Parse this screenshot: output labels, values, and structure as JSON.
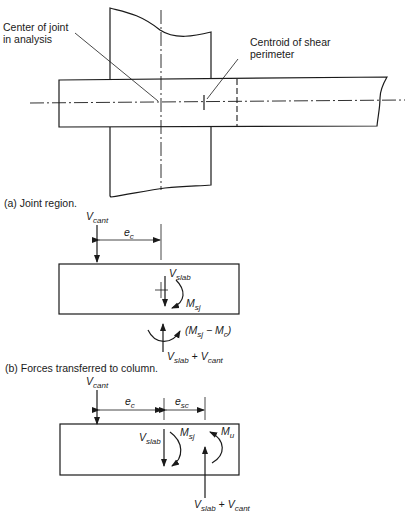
{
  "figure_a": {
    "caption": "(a) Joint region.",
    "label_center_joint_line1": "Center of joint",
    "label_center_joint_line2": "in analysis",
    "label_centroid_line1": "Centroid of shear",
    "label_centroid_line2": "perimeter"
  },
  "figure_b": {
    "caption": "(b) Forces transferred to column.",
    "v_cant": {
      "main": "V",
      "sub": "cant"
    },
    "e_c": {
      "main": "e",
      "sub": "c"
    },
    "v_slab": {
      "main": "V",
      "sub": "slab"
    },
    "m_sj": {
      "main": "M",
      "sub": "sj"
    },
    "moment_diff": {
      "open": "(M",
      "sub1": "sj",
      "mid": " − M",
      "sub2": "c",
      "close": ")"
    },
    "reaction": {
      "v1": "V",
      "sub1": "slab",
      "plus": " + ",
      "v2": "V",
      "sub2": "cant"
    }
  },
  "figure_c": {
    "v_cant": {
      "main": "V",
      "sub": "cant"
    },
    "e_c": {
      "main": "e",
      "sub": "c"
    },
    "e_sc": {
      "main": "e",
      "sub": "sc"
    },
    "v_slab": {
      "main": "V",
      "sub": "slab"
    },
    "m_sj": {
      "main": "M",
      "sub": "sj"
    },
    "m_u": {
      "main": "M",
      "sub": "u"
    },
    "reaction": {
      "v1": "V",
      "sub1": "slab",
      "plus": " + ",
      "v2": "V",
      "sub2": "cant"
    }
  }
}
